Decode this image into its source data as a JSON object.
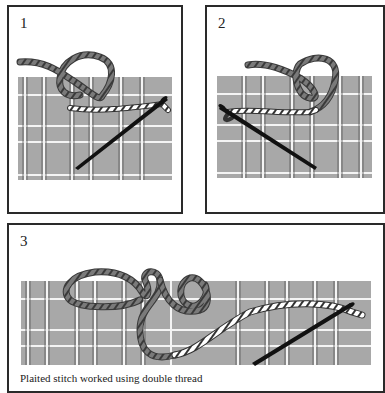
{
  "panels": [
    {
      "number": "1",
      "description": "Thread loop above canvas grid; needle inserted diagonally with white thread end"
    },
    {
      "number": "2",
      "description": "Needle pulled through to left; thread loop tightening above canvas grid"
    },
    {
      "number": "3",
      "description": "Thread looped and twisted across canvas grid; needle at right"
    }
  ],
  "caption": "Plaited stitch worked using double thread",
  "colors": {
    "canvas_fill": "#a8a8a8",
    "grid_line": "#f4f4f4",
    "grid_edge": "#444444",
    "dark_thread": "#6e6e6e",
    "light_thread": "#ffffff",
    "needle": "#111111",
    "frame_border": "#2a2a2a"
  }
}
